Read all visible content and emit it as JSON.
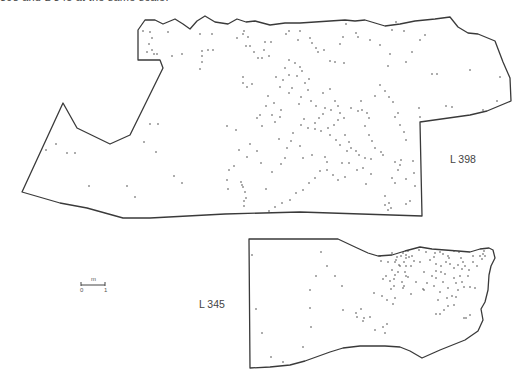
{
  "caption": "398 and L 345 at the same scale.",
  "plans": [
    {
      "label": "L 398",
      "label_pos": {
        "x": 450,
        "y": 160
      },
      "outline": "M138,60 L138,30 L145,20 L155,20 L163,24 L175,19 L183,24 L190,29 L197,21 L205,16 L215,22 L228,24 L237,19 L246,22 L255,21 L270,25 L285,23 L300,23 L315,22 L330,21 L345,20 L355,21 L365,20 L385,26 L400,24 L415,21 L435,19 L450,17 L458,27 L468,33 L478,34 L495,41 L503,62 L510,78 L511,101 L487,111 L470,115 L420,122 L422,216 L300,212 L225,214 L150,218 L123,218 L87,208 L60,203 L22,192 L63,103 L77,128 L110,144 L130,135 L163,68 L160,60 Z",
      "dots": [
        [
          143,
          31
        ],
        [
          150,
          32
        ],
        [
          152,
          38
        ],
        [
          149,
          44
        ],
        [
          147,
          52
        ],
        [
          152,
          50
        ],
        [
          154,
          54
        ],
        [
          157,
          54
        ],
        [
          168,
          32
        ],
        [
          172,
          56
        ],
        [
          182,
          54
        ],
        [
          200,
          34
        ],
        [
          202,
          51
        ],
        [
          202,
          56
        ],
        [
          208,
          50
        ],
        [
          200,
          69
        ],
        [
          202,
          62
        ],
        [
          213,
          50
        ],
        [
          212,
          34
        ],
        [
          237,
          38
        ],
        [
          243,
          34
        ],
        [
          246,
          46
        ],
        [
          244,
          31
        ],
        [
          248,
          37
        ],
        [
          250,
          46
        ],
        [
          254,
          52
        ],
        [
          258,
          58
        ],
        [
          262,
          58
        ],
        [
          264,
          50
        ],
        [
          265,
          42
        ],
        [
          243,
          83
        ],
        [
          247,
          87
        ],
        [
          252,
          84
        ],
        [
          243,
          77
        ],
        [
          269,
          56
        ],
        [
          271,
          42
        ],
        [
          286,
          34
        ],
        [
          289,
          31
        ],
        [
          298,
          40
        ],
        [
          300,
          31
        ],
        [
          310,
          38
        ],
        [
          312,
          43
        ],
        [
          316,
          48
        ],
        [
          318,
          52
        ],
        [
          324,
          50
        ],
        [
          289,
          60
        ],
        [
          295,
          63
        ],
        [
          300,
          67
        ],
        [
          302,
          71
        ],
        [
          297,
          76
        ],
        [
          292,
          88
        ],
        [
          289,
          93
        ],
        [
          305,
          83
        ],
        [
          309,
          79
        ],
        [
          311,
          101
        ],
        [
          316,
          106
        ],
        [
          323,
          114
        ],
        [
          319,
          118
        ],
        [
          315,
          123
        ],
        [
          304,
          119
        ],
        [
          299,
          104
        ],
        [
          301,
          97
        ],
        [
          308,
          90
        ],
        [
          323,
          93
        ],
        [
          330,
          89
        ],
        [
          335,
          101
        ],
        [
          338,
          106
        ],
        [
          340,
          113
        ],
        [
          344,
          118
        ],
        [
          345,
          135
        ],
        [
          349,
          142
        ],
        [
          351,
          148
        ],
        [
          347,
          151
        ],
        [
          340,
          145
        ],
        [
          336,
          140
        ],
        [
          330,
          135
        ],
        [
          328,
          128
        ],
        [
          334,
          125
        ],
        [
          338,
          120
        ],
        [
          331,
          110
        ],
        [
          325,
          108
        ],
        [
          351,
          108
        ],
        [
          358,
          111
        ],
        [
          365,
          126
        ],
        [
          369,
          135
        ],
        [
          372,
          141
        ],
        [
          375,
          148
        ],
        [
          381,
          152
        ],
        [
          383,
          155
        ],
        [
          371,
          159
        ],
        [
          365,
          158
        ],
        [
          359,
          155
        ],
        [
          356,
          151
        ],
        [
          345,
          177
        ],
        [
          338,
          180
        ],
        [
          333,
          175
        ],
        [
          327,
          170
        ],
        [
          320,
          171
        ],
        [
          315,
          178
        ],
        [
          309,
          183
        ],
        [
          303,
          190
        ],
        [
          296,
          193
        ],
        [
          290,
          200
        ],
        [
          282,
          203
        ],
        [
          275,
          207
        ],
        [
          269,
          211
        ],
        [
          241,
          182
        ],
        [
          243,
          187
        ],
        [
          245,
          192
        ],
        [
          246,
          198
        ],
        [
          244,
          206
        ],
        [
          266,
          189
        ],
        [
          272,
          172
        ],
        [
          281,
          164
        ],
        [
          285,
          158
        ],
        [
          287,
          148
        ],
        [
          291,
          141
        ],
        [
          293,
          133
        ],
        [
          301,
          125
        ],
        [
          308,
          128
        ],
        [
          315,
          129
        ],
        [
          321,
          131
        ],
        [
          361,
          101
        ],
        [
          362,
          110
        ],
        [
          367,
          113
        ],
        [
          369,
          118
        ],
        [
          375,
          96
        ],
        [
          380,
          85
        ],
        [
          385,
          91
        ],
        [
          389,
          97
        ],
        [
          393,
          102
        ],
        [
          395,
          117
        ],
        [
          398,
          113
        ],
        [
          400,
          125
        ],
        [
          404,
          132
        ],
        [
          406,
          140
        ],
        [
          401,
          160
        ],
        [
          400,
          165
        ],
        [
          398,
          170
        ],
        [
          392,
          178
        ],
        [
          395,
          183
        ],
        [
          385,
          196
        ],
        [
          389,
          203
        ],
        [
          391,
          208
        ],
        [
          388,
          210
        ],
        [
          385,
          205
        ],
        [
          406,
          204
        ],
        [
          410,
          201
        ],
        [
          413,
          161
        ],
        [
          414,
          173
        ],
        [
          406,
          179
        ],
        [
          415,
          186
        ],
        [
          395,
          162
        ],
        [
          406,
          62
        ],
        [
          390,
          54
        ],
        [
          388,
          66
        ],
        [
          412,
          52
        ],
        [
          420,
          40
        ],
        [
          425,
          35
        ],
        [
          432,
          74
        ],
        [
          437,
          74
        ],
        [
          446,
          106
        ],
        [
          452,
          107
        ],
        [
          420,
          117
        ],
        [
          419,
          108
        ],
        [
          470,
          70
        ],
        [
          483,
          110
        ],
        [
          497,
          101
        ],
        [
          500,
          77
        ],
        [
          404,
          31
        ],
        [
          396,
          22
        ],
        [
          380,
          45
        ],
        [
          392,
          30
        ],
        [
          370,
          40
        ],
        [
          358,
          37
        ],
        [
          346,
          24
        ],
        [
          356,
          33
        ],
        [
          343,
          37
        ],
        [
          340,
          44
        ],
        [
          330,
          61
        ],
        [
          335,
          62
        ],
        [
          344,
          63
        ],
        [
          150,
          124
        ],
        [
          158,
          124
        ],
        [
          156,
          152
        ],
        [
          174,
          176
        ],
        [
          182,
          183
        ],
        [
          144,
          142
        ],
        [
          67,
          153
        ],
        [
          56,
          144
        ],
        [
          46,
          150
        ],
        [
          75,
          153
        ],
        [
          89,
          186
        ],
        [
          127,
          186
        ],
        [
          135,
          197
        ],
        [
          227,
          180
        ],
        [
          228,
          189
        ],
        [
          242,
          185
        ],
        [
          244,
          201
        ],
        [
          268,
          96
        ],
        [
          266,
          106
        ],
        [
          272,
          115
        ],
        [
          275,
          122
        ],
        [
          257,
          118
        ],
        [
          260,
          115
        ],
        [
          250,
          144
        ],
        [
          257,
          151
        ],
        [
          261,
          163
        ],
        [
          239,
          150
        ],
        [
          262,
          126
        ],
        [
          280,
          117
        ],
        [
          281,
          110
        ],
        [
          274,
          103
        ],
        [
          280,
          87
        ],
        [
          283,
          80
        ],
        [
          289,
          75
        ],
        [
          285,
          68
        ],
        [
          276,
          77
        ],
        [
          279,
          139
        ],
        [
          227,
          126
        ],
        [
          236,
          130
        ],
        [
          229,
          170
        ],
        [
          234,
          166
        ],
        [
          247,
          157
        ],
        [
          300,
          146
        ],
        [
          303,
          158
        ],
        [
          312,
          155
        ],
        [
          325,
          157
        ],
        [
          327,
          162
        ],
        [
          342,
          163
        ],
        [
          349,
          163
        ],
        [
          357,
          170
        ],
        [
          363,
          168
        ],
        [
          371,
          174
        ],
        [
          366,
          184
        ]
      ]
    },
    {
      "label": "L 345",
      "label_pos": {
        "x": 199,
        "y": 305
      },
      "outline": "M249,239 L338,239 L355,247 L368,253 L378,256 L392,255 L405,251 L420,247 L432,249 L445,250 L458,251 L470,252 L480,249 L489,248 L493,250 L495,258 L491,266 L489,275 L488,290 L485,302 L481,309 L483,320 L478,331 L465,340 L440,350 L422,358 L410,351 L400,347 L385,346 L360,346 L343,348 L330,352 L305,361 L290,365 L270,367 L250,368 Z",
      "dots": [
        [
          252,
          255
        ],
        [
          256,
          309
        ],
        [
          262,
          333
        ],
        [
          271,
          357
        ],
        [
          283,
          362
        ],
        [
          303,
          347
        ],
        [
          311,
          327
        ],
        [
          310,
          308
        ],
        [
          310,
          290
        ],
        [
          316,
          276
        ],
        [
          321,
          252
        ],
        [
          327,
          266
        ],
        [
          335,
          276
        ],
        [
          342,
          286
        ],
        [
          343,
          310
        ],
        [
          356,
          313
        ],
        [
          357,
          317
        ],
        [
          361,
          309
        ],
        [
          363,
          321
        ],
        [
          364,
          318
        ],
        [
          370,
          317
        ],
        [
          375,
          330
        ],
        [
          383,
          327
        ],
        [
          385,
          333
        ],
        [
          387,
          324
        ],
        [
          394,
          286
        ],
        [
          390,
          281
        ],
        [
          394,
          279
        ],
        [
          383,
          279
        ],
        [
          386,
          276
        ],
        [
          395,
          262
        ],
        [
          392,
          270
        ],
        [
          400,
          266
        ],
        [
          404,
          262
        ],
        [
          406,
          258
        ],
        [
          409,
          257
        ],
        [
          406,
          255
        ],
        [
          403,
          253
        ],
        [
          408,
          251
        ],
        [
          397,
          257
        ],
        [
          392,
          253
        ],
        [
          396,
          260
        ],
        [
          401,
          256
        ],
        [
          406,
          266
        ],
        [
          412,
          256
        ],
        [
          414,
          261
        ],
        [
          411,
          266
        ],
        [
          405,
          272
        ],
        [
          398,
          272
        ],
        [
          388,
          262
        ],
        [
          395,
          275
        ],
        [
          399,
          265
        ],
        [
          406,
          276
        ],
        [
          408,
          277
        ],
        [
          404,
          286
        ],
        [
          403,
          288
        ],
        [
          391,
          289
        ],
        [
          395,
          298
        ],
        [
          393,
          304
        ],
        [
          387,
          300
        ],
        [
          374,
          293
        ],
        [
          382,
          296
        ],
        [
          402,
          282
        ],
        [
          420,
          262
        ],
        [
          426,
          252
        ],
        [
          430,
          260
        ],
        [
          434,
          257
        ],
        [
          436,
          264
        ],
        [
          441,
          266
        ],
        [
          446,
          262
        ],
        [
          448,
          256
        ],
        [
          450,
          264
        ],
        [
          454,
          268
        ],
        [
          458,
          265
        ],
        [
          449,
          258
        ],
        [
          445,
          274
        ],
        [
          441,
          272
        ],
        [
          436,
          271
        ],
        [
          432,
          276
        ],
        [
          424,
          272
        ],
        [
          427,
          283
        ],
        [
          424,
          290
        ],
        [
          436,
          278
        ],
        [
          443,
          282
        ],
        [
          448,
          288
        ],
        [
          454,
          278
        ],
        [
          456,
          283
        ],
        [
          458,
          290
        ],
        [
          452,
          296
        ],
        [
          447,
          298
        ],
        [
          440,
          292
        ],
        [
          434,
          286
        ],
        [
          438,
          300
        ],
        [
          436,
          314
        ],
        [
          440,
          314
        ],
        [
          444,
          310
        ],
        [
          448,
          306
        ],
        [
          454,
          305
        ],
        [
          456,
          297
        ],
        [
          463,
          262
        ],
        [
          465,
          266
        ],
        [
          469,
          270
        ],
        [
          473,
          262
        ],
        [
          473,
          256
        ],
        [
          477,
          266
        ],
        [
          468,
          276
        ],
        [
          460,
          276
        ],
        [
          462,
          282
        ],
        [
          464,
          287
        ],
        [
          470,
          287
        ],
        [
          475,
          288
        ],
        [
          462,
          269
        ],
        [
          461,
          258
        ],
        [
          480,
          256
        ],
        [
          483,
          254
        ],
        [
          485,
          256
        ],
        [
          484,
          251
        ],
        [
          482,
          259
        ],
        [
          464,
          318
        ],
        [
          466,
          318
        ],
        [
          470,
          315
        ],
        [
          435,
          253
        ],
        [
          440,
          252
        ],
        [
          443,
          254
        ],
        [
          454,
          251
        ],
        [
          459,
          252
        ],
        [
          419,
          250
        ],
        [
          416,
          282
        ],
        [
          380,
          256
        ],
        [
          381,
          261
        ],
        [
          423,
          289
        ],
        [
          411,
          294
        ]
      ]
    }
  ],
  "scale_bar": {
    "unit_label": "m",
    "tick_labels": [
      "0",
      "1"
    ],
    "x1": 81,
    "x2": 105,
    "y": 285
  }
}
